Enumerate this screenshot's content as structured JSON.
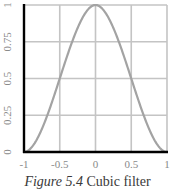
{
  "chart_data": {
    "type": "line",
    "title": "",
    "caption_label": "Figure 5.4",
    "caption_text": "Cubic filter",
    "xlabel": "",
    "ylabel": "",
    "xlim": [
      -1,
      1
    ],
    "ylim": [
      0,
      1
    ],
    "x_ticks": [
      "-1",
      "-0.5",
      "0",
      "0.5",
      "1"
    ],
    "y_ticks": [
      "0",
      "0.25",
      "0.5",
      "0.75",
      "1"
    ],
    "grid": true,
    "legend": null,
    "series": [
      {
        "name": "Cubic filter",
        "function": "1 - 3|x|^2 + 2|x|^3",
        "x": [
          -1,
          -0.875,
          -0.75,
          -0.625,
          -0.5,
          -0.375,
          -0.25,
          -0.125,
          0,
          0.125,
          0.25,
          0.375,
          0.5,
          0.625,
          0.75,
          0.875,
          1
        ],
        "y": [
          0,
          0.043,
          0.156,
          0.316,
          0.5,
          0.684,
          0.844,
          0.957,
          1,
          0.957,
          0.844,
          0.684,
          0.5,
          0.316,
          0.156,
          0.043,
          0
        ]
      }
    ],
    "colors": {
      "curve": "#a3a3a3",
      "grid": "#c4c4c4",
      "axis": "#000000",
      "tick_label": "#8a8a8a"
    }
  }
}
